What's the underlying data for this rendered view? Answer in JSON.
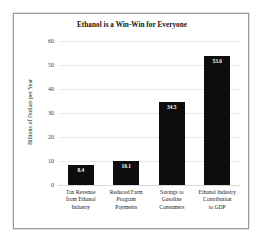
{
  "figure": {
    "border_color": "#9a9a9a",
    "background_color": "#ffffff"
  },
  "chart_data": {
    "type": "bar",
    "title": "Ethanol is a Win-Win for Everyone",
    "xlabel": "",
    "ylabel": "Billions of Dollars per Year",
    "ylim": [
      0,
      60
    ],
    "yticks": [
      "0",
      "10",
      "20",
      "30",
      "40",
      "50",
      "60"
    ],
    "ytick_values": [
      0,
      10,
      20,
      30,
      40,
      50,
      60
    ],
    "grid": "horizontal",
    "legend": "none",
    "bar_color": "#0d0d0d",
    "value_label_color": "#ffffff",
    "categories": [
      "Tax Revenue from Ethanol Industry",
      "Reduced Farm Program Payments",
      "Savings to Gasoline Consumers",
      "Ethanol Industry Contribution to GDP"
    ],
    "values": [
      8.4,
      10.1,
      34.5,
      53.6
    ],
    "value_labels": [
      "8.4",
      "10.1",
      "34.5",
      "53.6"
    ],
    "category_lines": [
      [
        "Tax Revenue",
        "from Ethanol",
        "Industry"
      ],
      [
        "Reduced Farm",
        "Program",
        "Payments"
      ],
      [
        "Savings to",
        "Gasoline",
        "Consumers"
      ],
      [
        "Ethanol Industry",
        "Contribution",
        "to GDP"
      ]
    ]
  }
}
